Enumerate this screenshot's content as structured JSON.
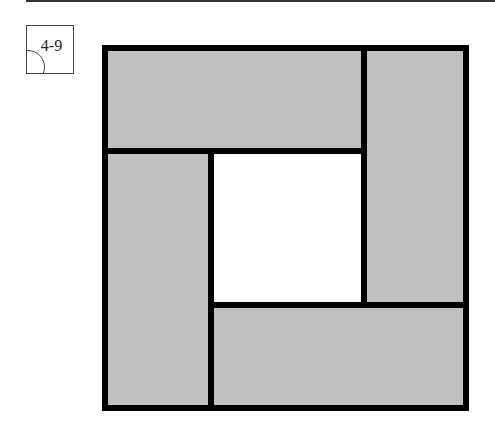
{
  "figure": {
    "label": "4-9",
    "colors": {
      "panel_fill": "#c0c0c0",
      "stroke": "#000000",
      "hole_fill": "#ffffff"
    }
  }
}
